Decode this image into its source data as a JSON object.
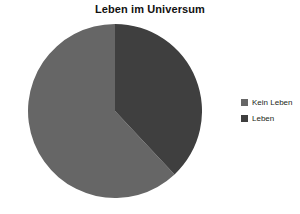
{
  "chart_data": {
    "type": "pie",
    "title": "Leben im Universum",
    "categories": [
      "Kein Leben",
      "Leben"
    ],
    "values": [
      62,
      38
    ],
    "colors": [
      "#666666",
      "#3f3f3f"
    ],
    "start_angle_deg": 0,
    "direction": "counterclockwise",
    "legend_position": "right",
    "xlabel": "",
    "ylabel": "",
    "grid": false
  },
  "chart": {
    "title": "Leben im Universum"
  },
  "legend": {
    "items": [
      {
        "label": "Kein Leben",
        "color": "#666666"
      },
      {
        "label": "Leben",
        "color": "#3f3f3f"
      }
    ]
  },
  "slices": [
    {
      "name": "Kein Leben",
      "value": 62,
      "color": "#666666"
    },
    {
      "name": "Leben",
      "value": 38,
      "color": "#3f3f3f"
    }
  ]
}
